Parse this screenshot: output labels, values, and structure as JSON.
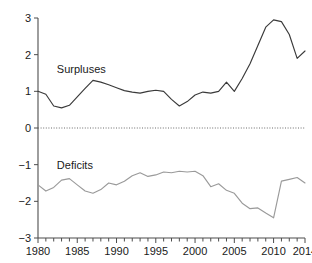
{
  "chart_data": {
    "type": "line",
    "title": "",
    "subtitle": "",
    "xlabel": "",
    "ylabel": "",
    "xlim": [
      1980,
      2014
    ],
    "ylim": [
      -3,
      3
    ],
    "grid": false,
    "legend_position": "inline-annotation",
    "zero_reference_line": true,
    "x_tick_labels": [
      "1980",
      "1985",
      "1990",
      "1995",
      "2000",
      "2005",
      "2010",
      "2014"
    ],
    "x_tick_values": [
      1980,
      1985,
      1990,
      1995,
      2000,
      2005,
      2010,
      2014
    ],
    "x_minor_tick_interval": 1,
    "y_tick_labels": [
      "3",
      "2",
      "1",
      "0",
      "-1",
      "-2",
      "-3"
    ],
    "y_tick_values": [
      3,
      2,
      1,
      0,
      -1,
      -2,
      -3
    ],
    "annotations": [
      {
        "text": "Surpluses",
        "x": 1982.4,
        "y": 1.62
      },
      {
        "text": "Deficits",
        "x": 1982.4,
        "y": -1.02
      }
    ],
    "x": [
      1980,
      1981,
      1982,
      1983,
      1984,
      1985,
      1986,
      1987,
      1988,
      1989,
      1990,
      1991,
      1992,
      1993,
      1994,
      1995,
      1996,
      1997,
      1998,
      1999,
      2000,
      2001,
      2002,
      2003,
      2004,
      2005,
      2006,
      2007,
      2008,
      2009,
      2010,
      2011,
      2012,
      2013,
      2014
    ],
    "series": [
      {
        "name": "Surpluses",
        "color": "#3a3a3a",
        "values": [
          1.0,
          0.92,
          0.6,
          0.55,
          0.62,
          0.85,
          1.08,
          1.3,
          1.25,
          1.18,
          1.1,
          1.02,
          0.98,
          0.95,
          1.0,
          1.03,
          1.0,
          0.78,
          0.6,
          0.72,
          0.9,
          0.98,
          0.95,
          1.0,
          1.25,
          1.0,
          1.35,
          1.75,
          2.25,
          2.75,
          2.95,
          2.9,
          2.55,
          1.9,
          2.1
        ]
      },
      {
        "name": "Deficits",
        "color": "#9a9a9a",
        "values": [
          -1.55,
          -1.72,
          -1.62,
          -1.42,
          -1.38,
          -1.55,
          -1.72,
          -1.78,
          -1.68,
          -1.5,
          -1.55,
          -1.45,
          -1.3,
          -1.22,
          -1.32,
          -1.28,
          -1.2,
          -1.22,
          -1.18,
          -1.2,
          -1.18,
          -1.3,
          -1.6,
          -1.52,
          -1.7,
          -1.78,
          -2.05,
          -2.2,
          -2.18,
          -2.32,
          -2.45,
          -1.45,
          -1.4,
          -1.35,
          -1.5
        ]
      }
    ]
  },
  "surplus_overrides": {
    "note": ""
  }
}
